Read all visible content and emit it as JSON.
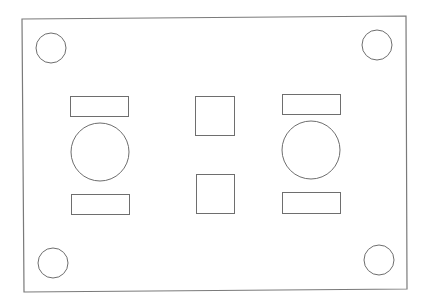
{
  "diagram": {
    "title": "",
    "shapes": {
      "plate": {
        "type": "rectangle",
        "label": "plate-outline"
      },
      "corner_holes": [
        {
          "label": "mounting-hole-top-left",
          "type": "circle"
        },
        {
          "label": "mounting-hole-top-right",
          "type": "circle"
        },
        {
          "label": "mounting-hole-bottom-left",
          "type": "circle"
        },
        {
          "label": "mounting-hole-bottom-right",
          "type": "circle"
        }
      ],
      "large_openings": [
        {
          "label": "large-opening-left",
          "type": "circle"
        },
        {
          "label": "large-opening-right",
          "type": "circle"
        }
      ],
      "slots": [
        {
          "label": "slot-left-top",
          "type": "rectangle"
        },
        {
          "label": "slot-left-bottom",
          "type": "rectangle"
        },
        {
          "label": "slot-right-top",
          "type": "rectangle"
        },
        {
          "label": "slot-right-bottom",
          "type": "rectangle"
        }
      ],
      "squares": [
        {
          "label": "square-cutout-top",
          "type": "square"
        },
        {
          "label": "square-cutout-bottom",
          "type": "square"
        }
      ]
    },
    "colors": {
      "line": "#6e6e6e",
      "background": "#ffffff"
    }
  }
}
